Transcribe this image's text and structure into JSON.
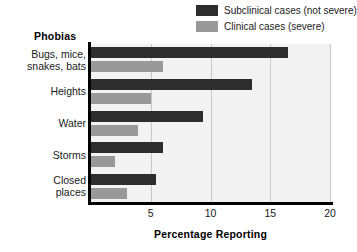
{
  "chart_data": {
    "type": "bar",
    "orientation": "horizontal",
    "title": "",
    "xlabel": "Percentage Reporting",
    "ylabel": "Phobias",
    "categories": [
      "Bugs, mice,\nsnakes, bats",
      "Heights",
      "Water",
      "Storms",
      "Closed\nplaces"
    ],
    "category_lines": [
      [
        "Bugs, mice,",
        "snakes, bats"
      ],
      [
        "Heights"
      ],
      [
        "Water"
      ],
      [
        "Storms"
      ],
      [
        "Closed",
        "places"
      ]
    ],
    "series": [
      {
        "name": "Subclinical cases (not severe)",
        "color": "#2d2d2d",
        "values": [
          16.5,
          13.5,
          9.4,
          6.0,
          5.4
        ]
      },
      {
        "name": "Clinical cases (severe)",
        "color": "#999999",
        "values": [
          6.0,
          5.0,
          3.9,
          2.0,
          3.0
        ]
      }
    ],
    "xlim": [
      0,
      20
    ],
    "xticks": [
      5,
      10,
      15,
      20
    ],
    "xtick_labels": [
      "5",
      "10",
      "15",
      "20"
    ],
    "grid": true,
    "grid_axis": "x",
    "legend_position": "top-right",
    "plot_background": "#f2f2f2",
    "axis_color": "#000000",
    "gridline_color": "#c8c8c8"
  },
  "legend": {
    "items": [
      {
        "label": "Subclinical cases (not severe)",
        "color": "#2d2d2d"
      },
      {
        "label": "Clinical cases (severe)",
        "color": "#999999"
      }
    ]
  }
}
